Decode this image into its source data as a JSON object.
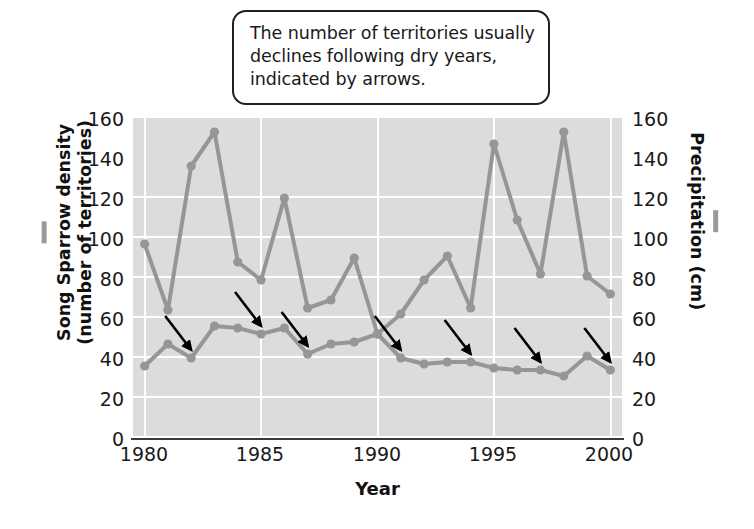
{
  "callout": {
    "lines": [
      "The number of territories usually",
      "declines following dry years,",
      "indicated by arrows."
    ]
  },
  "axis": {
    "xlabel": "Year",
    "ylabel_left_line1": "Song Sparrow density",
    "ylabel_left_line2": "(number of territories)",
    "ylabel_right": "Precipitation (cm)",
    "yticks": [
      "0",
      "20",
      "40",
      "60",
      "80",
      "100",
      "120",
      "140",
      "160"
    ],
    "xticks": [
      "1980",
      "1985",
      "1990",
      "1995",
      "2000"
    ]
  },
  "colors": {
    "line": "#969696",
    "plot_background": "#dcdcdc",
    "gridline": "#ffffff",
    "arrow": "#000000",
    "text": "#1a1a1a",
    "callout_border": "#231f20"
  },
  "chart_data": {
    "type": "line",
    "title": "",
    "xlabel": "Year",
    "ylabel": "Song Sparrow density (number of territories)",
    "ylabel_secondary": "Precipitation (cm)",
    "xlim": [
      1979.5,
      2000.5
    ],
    "ylim": [
      0,
      160
    ],
    "ylim_secondary": [
      0,
      160
    ],
    "ytick_step": 20,
    "xticks": [
      1980,
      1985,
      1990,
      1995,
      2000
    ],
    "grid": true,
    "legend": "none",
    "x": [
      1980,
      1981,
      1982,
      1983,
      1984,
      1985,
      1986,
      1987,
      1988,
      1989,
      1990,
      1991,
      1992,
      1993,
      1994,
      1995,
      1996,
      1997,
      1998,
      1999,
      2000
    ],
    "series": [
      {
        "name": "Precipitation (cm)",
        "axis": "right",
        "values": [
          97,
          64,
          136,
          153,
          88,
          79,
          120,
          65,
          69,
          90,
          52,
          62,
          79,
          91,
          65,
          147,
          109,
          82,
          153,
          81,
          72
        ]
      },
      {
        "name": "Song Sparrow density (number of territories)",
        "axis": "left",
        "values": [
          36,
          47,
          40,
          56,
          55,
          52,
          55,
          42,
          47,
          48,
          52,
          40,
          37,
          38,
          38,
          35,
          34,
          34,
          31,
          41,
          34
        ]
      }
    ],
    "annotations": {
      "note": "The number of territories usually declines following dry years, indicated by arrows.",
      "arrows_point_to_years": [
        1982,
        1985,
        1987,
        1991,
        1994,
        1997,
        2000
      ]
    }
  }
}
